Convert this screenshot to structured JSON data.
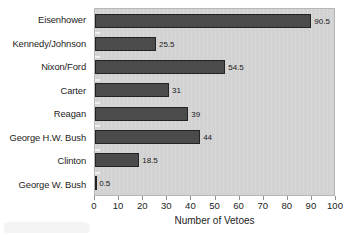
{
  "chart_data": {
    "type": "bar",
    "orientation": "horizontal",
    "title": "",
    "xlabel": "Number of Vetoes",
    "ylabel": "",
    "categories": [
      "Eisenhower",
      "Kennedy/Johnson",
      "Nixon/Ford",
      "Carter",
      "Reagan",
      "George H.W. Bush",
      "Clinton",
      "George W. Bush"
    ],
    "values": [
      90.5,
      25.5,
      54.5,
      31,
      39,
      44,
      18.5,
      0.5
    ],
    "value_labels": [
      "90.5",
      "25.5",
      "54.5",
      "31",
      "39",
      "44",
      "18.5",
      "0.5"
    ],
    "xlim": [
      0,
      100
    ],
    "xticks": [
      0,
      10,
      20,
      30,
      40,
      50,
      60,
      70,
      80,
      90,
      100
    ],
    "xticklabels": [
      "0",
      "10",
      "20",
      "30",
      "40",
      "50",
      "60",
      "70",
      "80",
      "90",
      "100"
    ],
    "grid": false,
    "legend": false,
    "colors": {
      "bar_fill": "#4b4b4b",
      "bar_edge": "#232323",
      "plot_background": "#d2d2d2",
      "plot_border": "#b6b6b6",
      "page_background": "#ffffff",
      "text": "#1c1c1c",
      "tick": "#8e8e8e"
    }
  }
}
